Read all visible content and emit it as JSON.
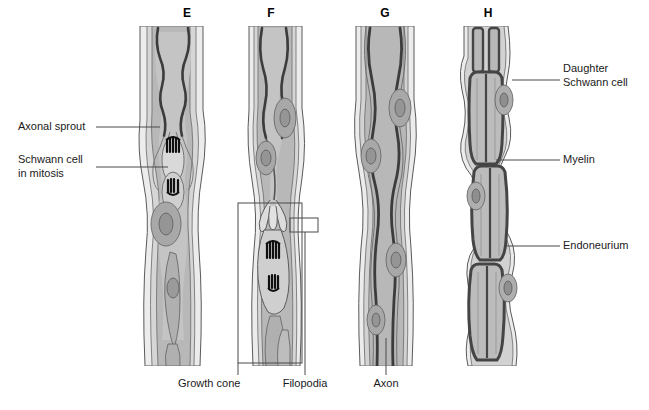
{
  "figure": {
    "panels": [
      {
        "id": "E",
        "letter": "E",
        "x": 187,
        "y": 17
      },
      {
        "id": "F",
        "letter": "F",
        "x": 271,
        "y": 17
      },
      {
        "id": "G",
        "letter": "G",
        "x": 385,
        "y": 17
      },
      {
        "id": "H",
        "letter": "H",
        "x": 488,
        "y": 17
      }
    ],
    "labels_left": [
      {
        "name": "axonal-sprout",
        "lines": [
          "Axonal sprout"
        ],
        "text_x": 18,
        "text_y": 130
      },
      {
        "name": "schwann-cell-in-mitosis",
        "lines": [
          "Schwann cell",
          "in mitosis"
        ],
        "text_x": 18,
        "text_y": 163
      }
    ],
    "labels_right": [
      {
        "name": "daughter-schwann-cell",
        "lines": [
          "Daughter",
          "Schwann cell"
        ],
        "text_x": 563,
        "text_y": 72
      },
      {
        "name": "myelin",
        "lines": [
          "Myelin"
        ],
        "text_x": 563,
        "text_y": 163
      },
      {
        "name": "endoneurium",
        "lines": [
          "Endoneurium"
        ],
        "text_x": 563,
        "text_y": 249
      }
    ],
    "labels_bottom": [
      {
        "name": "growth-cone",
        "lines": [
          "Growth cone"
        ],
        "text_x": 178,
        "text_y": 387
      },
      {
        "name": "filopodia",
        "lines": [
          "Filopodia"
        ],
        "text_x": 305,
        "text_y": 387
      },
      {
        "name": "axon",
        "lines": [
          "Axon"
        ],
        "text_x": 386,
        "text_y": 387
      }
    ],
    "colors": {
      "outline": "#5a5a5a",
      "endoneurium_fill": "#ececec",
      "schwann_fill": "#b8b8b8",
      "cytoplasm_fill": "#cbcbcb",
      "nucleus_fill": "#a0a0a0",
      "axon_dark": "#3c3c3c",
      "myelin_dark": "#454545",
      "mitosis_dark": "#101010",
      "leader_line": "#4a4a4a",
      "text": "#1a1a1a",
      "background": "#ffffff"
    }
  }
}
